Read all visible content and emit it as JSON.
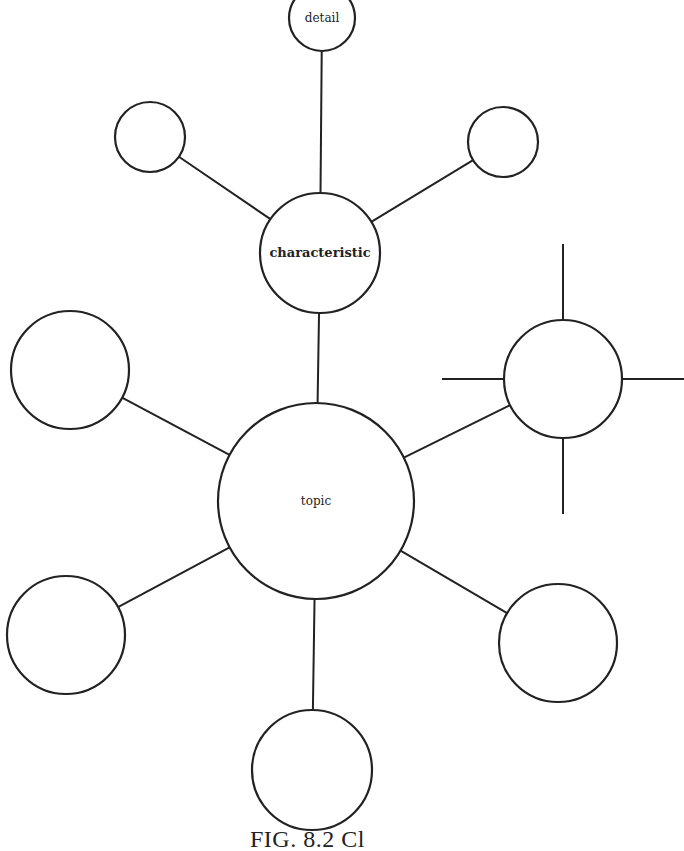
{
  "diagram": {
    "type": "cluster",
    "nodes": [
      {
        "id": "detail",
        "label": "detail"
      },
      {
        "id": "char-left",
        "label": ""
      },
      {
        "id": "char-right",
        "label": ""
      },
      {
        "id": "characteristic",
        "label": "characteristic"
      },
      {
        "id": "left-mid",
        "label": ""
      },
      {
        "id": "right-mid",
        "label": ""
      },
      {
        "id": "topic",
        "label": "topic"
      },
      {
        "id": "bottom-left",
        "label": ""
      },
      {
        "id": "bottom-right",
        "label": ""
      },
      {
        "id": "bottom",
        "label": ""
      }
    ],
    "edges": [
      [
        "detail",
        "characteristic"
      ],
      [
        "char-left",
        "characteristic"
      ],
      [
        "char-right",
        "characteristic"
      ],
      [
        "characteristic",
        "topic"
      ],
      [
        "left-mid",
        "topic"
      ],
      [
        "right-mid",
        "topic"
      ],
      [
        "bottom-left",
        "topic"
      ],
      [
        "bottom-right",
        "topic"
      ],
      [
        "bottom",
        "topic"
      ]
    ],
    "open_spokes": {
      "node": "right-mid",
      "directions": [
        "up",
        "left",
        "right",
        "down"
      ]
    }
  },
  "caption": "FIG. 8.2  Cl"
}
